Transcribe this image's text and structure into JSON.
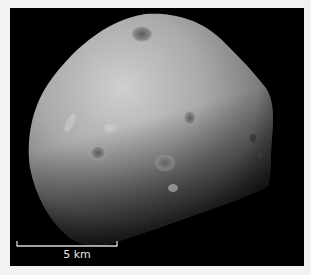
{
  "image": {
    "subject": "moon",
    "background_color": "#000000",
    "border_color": "#f2f2f2"
  },
  "scale_bar": {
    "label": "5 km",
    "color": "#d9d9d9"
  }
}
